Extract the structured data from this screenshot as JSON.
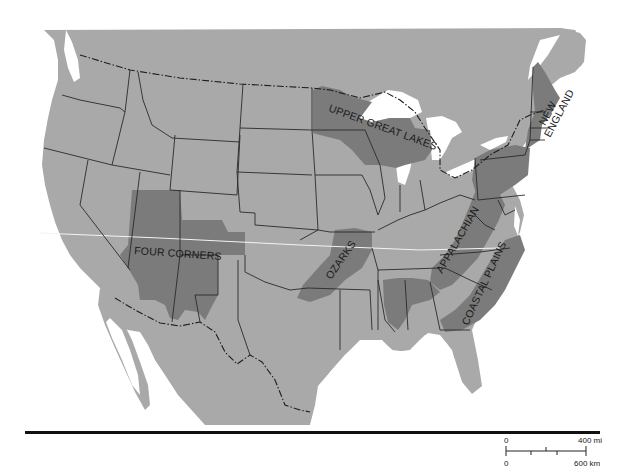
{
  "map": {
    "title": "",
    "colors": {
      "land": "#a9a9a9",
      "highlighted_region": "#7b7b7b",
      "water": "#ffffff",
      "borders": "#2a2a2a"
    },
    "regions": [
      {
        "id": "upper-great-lakes",
        "label": "UPPER GREAT LAKES"
      },
      {
        "id": "new-england",
        "label": "NEW ENGLAND"
      },
      {
        "id": "four-corners",
        "label": "FOUR CORNERS"
      },
      {
        "id": "ozarks",
        "label": "OZARKS"
      },
      {
        "id": "appalachian",
        "label": "APPALACHIAN"
      },
      {
        "id": "coastal-plains",
        "label": "COASTAL PLAINS"
      }
    ]
  },
  "scale_bar": {
    "mi_start": "0",
    "mi_end": "400 mi",
    "km_start": "0",
    "km_end": "600 km"
  }
}
